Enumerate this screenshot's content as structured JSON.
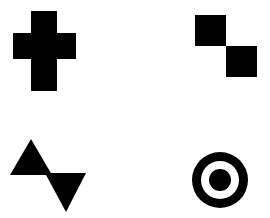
{
  "canvas": {
    "name": "geometric-shapes-canvas",
    "width": 270,
    "height": 218,
    "background_color": "#ffffff",
    "shape_color": "#000000",
    "description": "Four solid black geometric figures arranged in a two-by-two grid on a plain white background"
  },
  "shapes": [
    {
      "id": "plus-cross",
      "label": "Cross",
      "quadrant": "top-left",
      "fill": "#000000",
      "geometry": {
        "type": "cross",
        "bounds": {
          "x": 13,
          "y": 11,
          "width": 63,
          "height": 80
        },
        "vertical_bar": {
          "x": 31,
          "y": 11,
          "width": 26,
          "height": 80
        },
        "horizontal_bar": {
          "x": 13,
          "y": 33,
          "width": 63,
          "height": 26
        },
        "points": "31,11 57,11 57,33 76,33 76,59 57,59 57,91 31,91 31,59 13,59 13,33 31,33"
      }
    },
    {
      "id": "diagonal-squares",
      "label": "Diagonal Squares",
      "quadrant": "top-right",
      "fill": "#000000",
      "geometry": {
        "type": "squares",
        "count": 2,
        "items": [
          {
            "id": "square-upper-left",
            "x": 195,
            "y": 15,
            "width": 31,
            "height": 31
          },
          {
            "id": "square-lower-right",
            "x": 226,
            "y": 46,
            "width": 31,
            "height": 31
          }
        ]
      }
    },
    {
      "id": "bowtie-triangles",
      "label": "Opposed Triangles",
      "quadrant": "bottom-left",
      "fill": "#000000",
      "geometry": {
        "type": "triangles",
        "count": 2,
        "items": [
          {
            "id": "triangle-up",
            "orientation": "up",
            "points": "31,139 52,175 10,175"
          },
          {
            "id": "triangle-down",
            "orientation": "down",
            "points": "45,173 86,173 66,212"
          }
        ]
      }
    },
    {
      "id": "bullseye",
      "label": "Concentric Circles",
      "quadrant": "bottom-right",
      "geometry": {
        "type": "concentric-circles",
        "center": {
          "cx": 220,
          "cy": 180
        },
        "rings": [
          {
            "id": "outer-ring",
            "radius": 28,
            "fill": "#000000"
          },
          {
            "id": "middle-ring",
            "radius": 19,
            "fill": "#ffffff"
          },
          {
            "id": "inner-dot",
            "radius": 11,
            "fill": "#000000"
          }
        ]
      }
    }
  ]
}
